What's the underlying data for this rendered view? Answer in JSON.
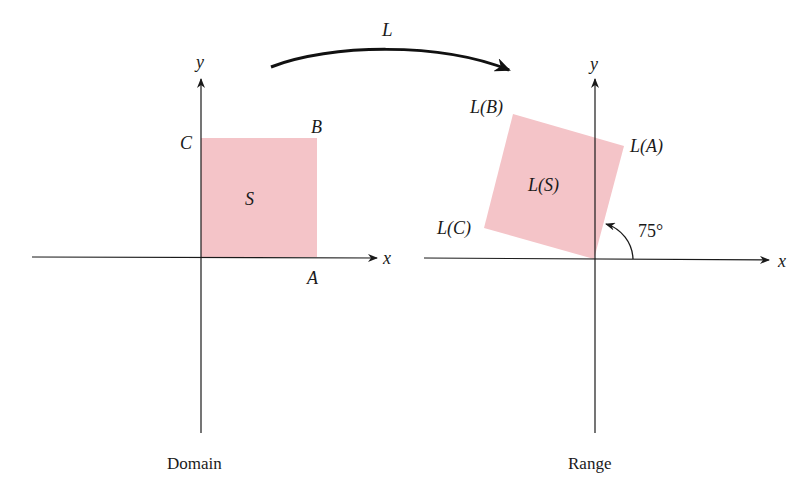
{
  "diagram": {
    "transformation_label": "L",
    "domain": {
      "caption": "Domain",
      "axis_x_label": "x",
      "axis_y_label": "y",
      "region_label": "S",
      "vertex_labels": {
        "A": "A",
        "B": "B",
        "C": "C"
      }
    },
    "range": {
      "caption": "Range",
      "axis_x_label": "x",
      "axis_y_label": "y",
      "region_label": "L(S)",
      "vertex_labels": {
        "A": "L(A)",
        "B": "L(B)",
        "C": "L(C)"
      },
      "rotation_angle_label": "75°"
    },
    "colors": {
      "region_fill": "#f4c4c8",
      "stroke": "#1a1a1a"
    }
  }
}
